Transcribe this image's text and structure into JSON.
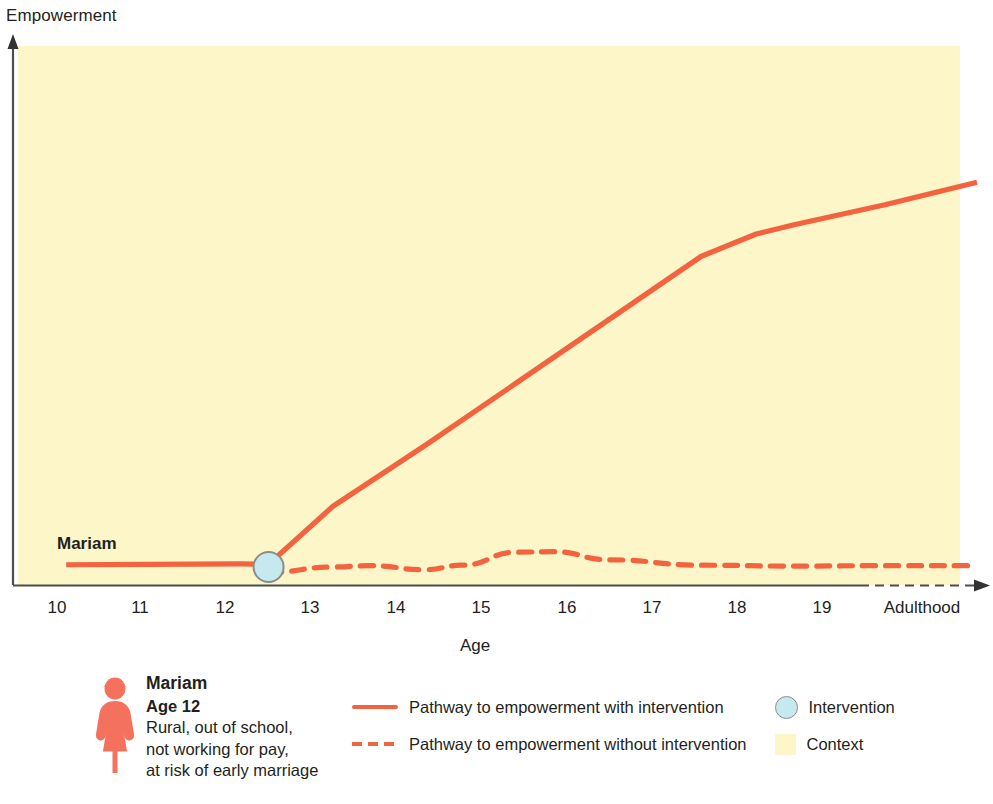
{
  "chart_data": {
    "type": "line",
    "title": "",
    "xlabel": "Age",
    "ylabel": "Empowerment",
    "categories": [
      "10",
      "11",
      "12",
      "13",
      "14",
      "15",
      "16",
      "17",
      "18",
      "19",
      "Adulthood"
    ],
    "xlim": [
      10,
      20
    ],
    "ylim": [
      0,
      100
    ],
    "grid": false,
    "legend_position": "bottom",
    "annotations": [
      {
        "name": "series-label",
        "text": "Mariam",
        "x": 10.45,
        "y": 10
      },
      {
        "name": "intervention-marker",
        "text": "Intervention",
        "x": 12.3,
        "y": 4
      }
    ],
    "series": [
      {
        "name": "Pathway to empowerment with intervention",
        "style": "solid",
        "color": "#f4633f",
        "x": [
          10.1,
          11.0,
          12.0,
          12.3,
          13.0,
          14.0,
          15.0,
          16.0,
          17.0,
          17.6,
          18.0,
          19.0,
          20.0
        ],
        "values": [
          4.5,
          4.6,
          4.7,
          4.6,
          17.5,
          31.0,
          45.0,
          59.0,
          73.0,
          78.0,
          80.0,
          84.5,
          89.5
        ]
      },
      {
        "name": "Pathway to empowerment without intervention",
        "style": "dashed",
        "color": "#f4633f",
        "x": [
          12.3,
          13.0,
          13.4,
          14.0,
          14.4,
          15.0,
          15.4,
          16.0,
          17.0,
          18.0,
          19.0,
          20.0
        ],
        "values": [
          2.8,
          4.0,
          4.3,
          3.4,
          4.4,
          7.3,
          7.4,
          5.6,
          4.4,
          4.2,
          4.3,
          4.3
        ]
      }
    ],
    "markers": [
      {
        "name": "intervention",
        "x": 12.3,
        "y": 4.0,
        "fill": "#c4e9ef",
        "stroke": "#8c8c8c",
        "radius": 15
      }
    ],
    "plot_background": "#fdf6c8"
  },
  "axes": {
    "y_title": "Empowerment",
    "x_title": "Age",
    "x_ticks": [
      "10",
      "11",
      "12",
      "13",
      "14",
      "15",
      "16",
      "17",
      "18",
      "19",
      "Adulthood"
    ]
  },
  "chart_labels": {
    "series_label": "Mariam"
  },
  "persona": {
    "icon": "female-person-icon",
    "icon_color": "#f4715e",
    "name": "Mariam",
    "age": "Age 12",
    "description_line_1": "Rural, out of school,",
    "description_line_2": "not working for pay,",
    "description_line_3": "at risk of early marriage"
  },
  "legend": {
    "left_items": [
      {
        "marker": "solid-line",
        "label": "Pathway to empowerment with intervention"
      },
      {
        "marker": "dashed-line",
        "label": "Pathway to empowerment without intervention"
      }
    ],
    "right_items": [
      {
        "marker": "circle",
        "label": "Intervention"
      },
      {
        "marker": "square",
        "label": "Context"
      }
    ]
  },
  "colors": {
    "line": "#f4633f",
    "context": "#fdf6c8",
    "intervention_fill": "#c4e9ef",
    "intervention_stroke": "#8c8c8c",
    "axis": "#4d4d4d",
    "text": "#231f20"
  }
}
